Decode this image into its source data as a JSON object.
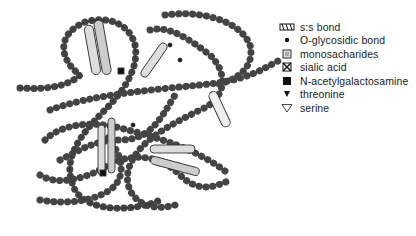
{
  "legend": {
    "items": [
      {
        "icon": "ss-bond-icon",
        "label": "s:s bond"
      },
      {
        "icon": "dot-icon",
        "label": "O-glycosidic bond"
      },
      {
        "icon": "hatched-square-icon",
        "label": "monosacharides"
      },
      {
        "icon": "cross-square-icon",
        "label": "sialic acid"
      },
      {
        "icon": "filled-square-icon",
        "label": "N-acetylgalactosamine"
      },
      {
        "icon": "filled-triangle-icon",
        "label": "threonine"
      },
      {
        "icon": "open-triangle-icon",
        "label": "serine"
      }
    ]
  },
  "colors": {
    "ink": "#1a1a1a",
    "bead_fill": "#ffffff",
    "sugar_fill": "#bdbdbd",
    "background": "#ffffff"
  }
}
